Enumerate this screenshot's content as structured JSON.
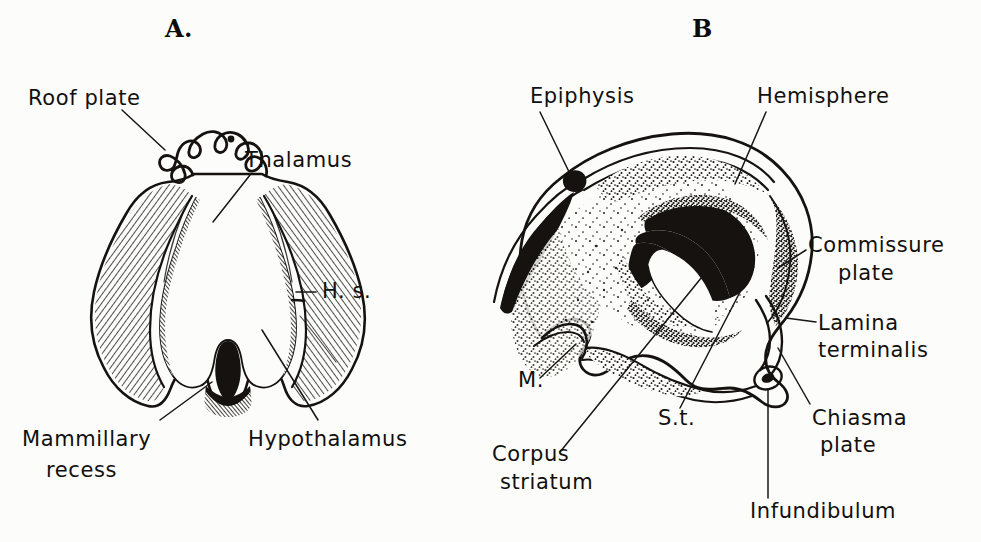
{
  "figure": {
    "background_color": "#fcfcfa",
    "ink_color": "#15120f",
    "width": 981,
    "height": 542
  },
  "panels": [
    {
      "id": "A",
      "letter": "A.",
      "description": "Transverse section through the diencephalon",
      "labels": [
        {
          "id": "roof-plate",
          "text": "Roof plate",
          "x": 28,
          "y": 105,
          "anchor": "start",
          "lines": [
            "Roof plate"
          ]
        },
        {
          "id": "thalamus",
          "text": "Thalamus",
          "x": 245,
          "y": 167,
          "anchor": "start",
          "lines": [
            "Thalamus"
          ]
        },
        {
          "id": "hs",
          "text": "H. s.",
          "x": 318,
          "y": 298,
          "anchor": "start",
          "lines": [
            "H. s."
          ]
        },
        {
          "id": "mammillary-recess",
          "text": "Mammillary recess",
          "x": 22,
          "y": 446,
          "anchor": "start",
          "lines": [
            "Mammillary",
            "recess"
          ]
        },
        {
          "id": "hypothalamus",
          "text": "Hypothalamus",
          "x": 248,
          "y": 446,
          "anchor": "start",
          "lines": [
            "Hypothalamus"
          ]
        }
      ]
    },
    {
      "id": "B",
      "letter": "B",
      "description": "Median sagittal view of the embryonic brain",
      "labels": [
        {
          "id": "epiphysis",
          "text": "Epiphysis",
          "x": 530,
          "y": 103,
          "anchor": "start",
          "lines": [
            "Epiphysis"
          ]
        },
        {
          "id": "hemisphere",
          "text": "Hemisphere",
          "x": 757,
          "y": 103,
          "anchor": "start",
          "lines": [
            "Hemisphere"
          ]
        },
        {
          "id": "commissure-plate",
          "text": "Commissure plate",
          "x": 808,
          "y": 252,
          "anchor": "start",
          "lines": [
            "Commissure",
            "plate"
          ]
        },
        {
          "id": "lamina-terminalis",
          "text": "Lamina terminalis",
          "x": 818,
          "y": 330,
          "anchor": "start",
          "lines": [
            "Lamina",
            "terminalis"
          ]
        },
        {
          "id": "chiasma-plate",
          "text": "Chiasma plate",
          "x": 812,
          "y": 425,
          "anchor": "start",
          "lines": [
            "Chiasma",
            "plate"
          ]
        },
        {
          "id": "infundibulum",
          "text": "Infundibulum",
          "x": 750,
          "y": 515,
          "anchor": "start",
          "lines": [
            "Infundibulum"
          ]
        },
        {
          "id": "m",
          "text": "M.",
          "x": 518,
          "y": 387,
          "anchor": "start",
          "lines": [
            "M."
          ]
        },
        {
          "id": "st",
          "text": "S.t.",
          "x": 658,
          "y": 425,
          "anchor": "start",
          "lines": [
            "S.t."
          ]
        },
        {
          "id": "corpus-striatum",
          "text": "Corpus striatum",
          "x": 492,
          "y": 461,
          "anchor": "start",
          "lines": [
            "Corpus",
            "striatum"
          ]
        }
      ]
    }
  ]
}
